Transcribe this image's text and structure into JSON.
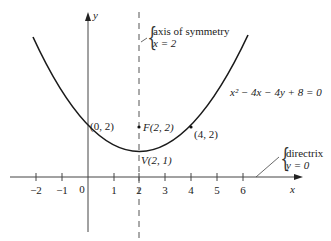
{
  "diagram": {
    "equation": "x² − 4x − 4y + 8 = 0",
    "axes": {
      "x_label": "x",
      "y_label": "y",
      "origin_label": "0",
      "x_ticks": [
        "−2",
        "−1",
        "1",
        "2",
        "3",
        "4",
        "5",
        "6"
      ]
    },
    "points": {
      "y_intercept": "(0, 2)",
      "focus": "F(2, 2)",
      "vertex": "V(2, 1)",
      "point": "(4, 2)"
    },
    "axis_of_symmetry": {
      "line1": "axis of symmetry",
      "line2": "x = 2"
    },
    "directrix": {
      "line1": "directrix",
      "line2": "y = 0"
    },
    "colors": {
      "curve": "#1a1a1a",
      "axes": "#444444",
      "dashed": "#555555"
    }
  }
}
